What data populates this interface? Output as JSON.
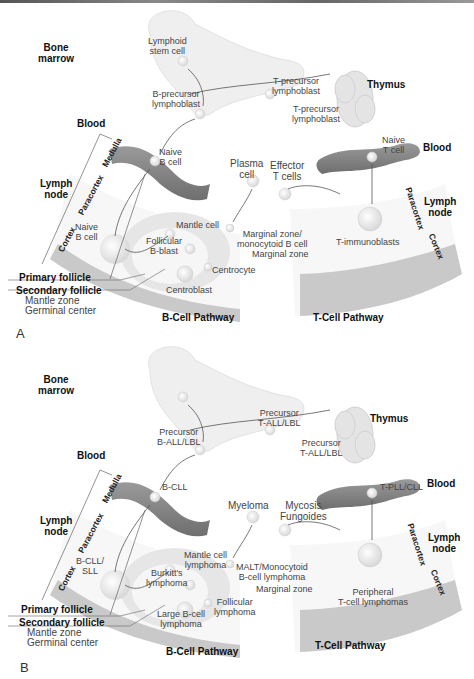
{
  "colors": {
    "blood_vessel": "#8a8a8a",
    "bone": "#eeeeee",
    "cortex": "#c8c8c8",
    "lymph_node_fill": "#f7f7f7",
    "text": "#444444",
    "heading_text": "#111111"
  },
  "panels": [
    {
      "letter": "A",
      "organs": {
        "bone_marrow": "Bone\nmarrow",
        "thymus": "Thymus",
        "blood_left": "Blood",
        "blood_right": "Blood",
        "lymph_node_left": "Lymph\nnode",
        "lymph_node_right": "Lymph\nnode"
      },
      "zones": {
        "medulla": "Medulla",
        "paracortex_left": "Paracortex",
        "cortex_left": "Cortex",
        "paracortex_right": "Paracortex",
        "cortex_right": "Cortex"
      },
      "cells": {
        "lymphoid_stem": "Lymphoid\nstem cell",
        "b_precursor": "B-precursor\nlymphoblast",
        "t_precursor_1": "T-precursor\nlymphoblast",
        "t_precursor_2": "T-precursor\nlymphoblast",
        "naive_b_blood": "Naive\nB cell",
        "naive_t_blood": "Naive\nT cell",
        "plasma": "Plasma\ncell",
        "effector_t": "Effector\nT cells",
        "naive_b_node": "Naive\nB cell",
        "mantle": "Mantle cell",
        "follicular_blast": "Follicular\nB-blast",
        "marginal_zone_cell": "Marginal zone/\nmonocytoid B cell",
        "marginal_zone": "Marginal zone",
        "centrocyte": "Centrocyte",
        "centroblast": "Centroblast",
        "t_immunoblasts": "T-immunoblasts"
      },
      "follicle_labels": {
        "primary": "Primary follicle",
        "secondary": "Secondary follicle",
        "mantle_zone": "Mantle zone",
        "germinal_center": "Germinal center"
      },
      "pathways": {
        "b": "B-Cell Pathway",
        "t": "T-Cell Pathway"
      }
    },
    {
      "letter": "B",
      "organs": {
        "bone_marrow": "Bone\nmarrow",
        "thymus": "Thymus",
        "blood_left": "Blood",
        "blood_right": "Blood",
        "lymph_node_left": "Lymph\nnode",
        "lymph_node_right": "Lymph\nnode"
      },
      "zones": {
        "medulla": "Medulla",
        "paracortex_left": "Paracortex",
        "cortex_left": "Cortex",
        "paracortex_right": "Paracortex",
        "cortex_right": "Cortex"
      },
      "cells": {
        "lymphoid_stem": "",
        "b_precursor": "Precursor\nB-ALL/LBL",
        "t_precursor_1": "Precursor\nT-ALL/LBL",
        "t_precursor_2": "Precursor\nT-ALL/LBL",
        "naive_b_blood": "B-CLL",
        "naive_t_blood": "T-PLL/CLL",
        "plasma": "Myeloma",
        "effector_t": "Mycosis\nFungoides",
        "naive_b_node": "B-CLL/\nSLL",
        "mantle": "Mantle cell\nlymphoma",
        "follicular_blast": "Burkitt's\nlymphoma",
        "marginal_zone_cell": "MALT/Monocytoid\nB-cell lymphoma",
        "marginal_zone": "Marginal zone",
        "centrocyte": "Follicular\nlymphoma",
        "centroblast": "Large B-cell\nlymphoma",
        "t_immunoblasts": "Peripheral\nT-cell lymphomas"
      },
      "follicle_labels": {
        "primary": "Primary follicle",
        "secondary": "Secondary follicle",
        "mantle_zone": "Mantle zone",
        "germinal_center": "Germinal center"
      },
      "pathways": {
        "b": "B-Cell Pathway",
        "t": "T-Cell Pathway"
      }
    }
  ]
}
